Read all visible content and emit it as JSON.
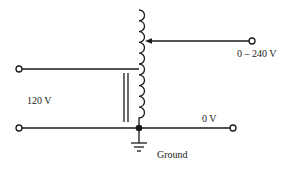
{
  "diagram": {
    "type": "autotransformer (variac) schematic",
    "labels": {
      "output_range": "0 – 240 V",
      "input_voltage": "120 V",
      "common_voltage": "0 V",
      "ground": "Ground"
    },
    "colors": {
      "line": "#1a1a1a",
      "background": "#ffffff",
      "text": "#222222"
    },
    "components": [
      {
        "id": "coil",
        "kind": "inductor-winding",
        "turns": 11
      },
      {
        "id": "core",
        "kind": "iron-core",
        "lines": 2
      },
      {
        "id": "wiper",
        "kind": "sliding-tap-arrow"
      },
      {
        "id": "ground",
        "kind": "ground-symbol"
      },
      {
        "id": "terminals",
        "kind": "open-circle",
        "count": 4
      }
    ]
  }
}
